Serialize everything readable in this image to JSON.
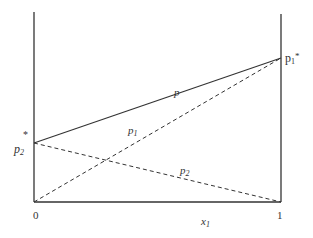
{
  "diagram": {
    "type": "vapor-pressure composition diagram (Raoult's law)",
    "colors": {
      "line": "#333333",
      "background": "#ffffff"
    },
    "axes": {
      "x_label": "x",
      "x_label_sub": "1",
      "x_tick_left": "0",
      "x_tick_right": "1"
    },
    "labels": {
      "p_total": "p",
      "p1": "p",
      "p1_sub": "1",
      "p2": "p",
      "p2_sub": "2",
      "p1_star": "p",
      "p1_star_sub": "1",
      "p1_star_sup": "*",
      "p2_star": "p",
      "p2_star_sub": "2",
      "p2_star_sup": "*"
    },
    "lines": [
      {
        "name": "p",
        "style": "solid",
        "from": [
          0,
          "p2*"
        ],
        "to": [
          1,
          "p1*"
        ]
      },
      {
        "name": "p1",
        "style": "dashed",
        "from": [
          0,
          0
        ],
        "to": [
          1,
          "p1*"
        ]
      },
      {
        "name": "p2",
        "style": "dashed",
        "from": [
          0,
          "p2*"
        ],
        "to": [
          1,
          0
        ]
      }
    ]
  }
}
